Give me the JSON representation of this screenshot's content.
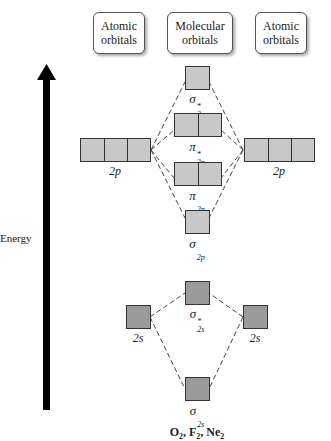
{
  "headers": {
    "left": [
      "Atomic",
      "orbitals"
    ],
    "center": [
      "Molecular",
      "orbitals"
    ],
    "right": [
      "Atomic",
      "orbitals"
    ]
  },
  "axis": {
    "label": "Energy"
  },
  "atomic_orbitals": {
    "left_2p": {
      "label": "2p",
      "boxes": 3
    },
    "right_2p": {
      "label": "2p",
      "boxes": 3
    },
    "left_2s": {
      "label": "2s",
      "boxes": 1
    },
    "right_2s": {
      "label": "2s",
      "boxes": 1
    }
  },
  "molecular_orbitals": [
    {
      "id": "sigma_star_2p",
      "symbol": "σ",
      "sub": "2p",
      "sup": "*",
      "boxes": 1
    },
    {
      "id": "pi_star_2p",
      "symbol": "π",
      "sub": "2p",
      "sup": "*",
      "boxes": 2
    },
    {
      "id": "pi_2p",
      "symbol": "π",
      "sub": "2p",
      "sup": "",
      "boxes": 2
    },
    {
      "id": "sigma_2p",
      "symbol": "σ",
      "sub": "2p",
      "sup": "",
      "boxes": 1
    },
    {
      "id": "sigma_star_2s",
      "symbol": "σ",
      "sub": "2s",
      "sup": "*",
      "boxes": 1
    },
    {
      "id": "sigma_2s",
      "symbol": "σ",
      "sub": "2s",
      "sup": "",
      "boxes": 1
    }
  ],
  "caption": {
    "parts": [
      "O",
      "2",
      ", F",
      "2",
      ", Ne",
      "2"
    ]
  },
  "colors": {
    "orbital_2p_fill": "#c8c8c8",
    "orbital_2s_fill": "#9b9b9b",
    "arrow": "#000000"
  }
}
